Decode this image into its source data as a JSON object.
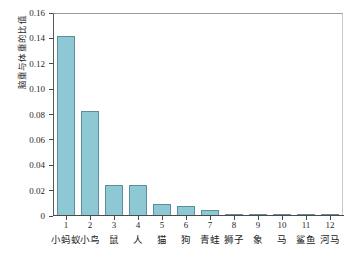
{
  "chart_data": {
    "type": "bar",
    "title": "",
    "subtitle": "",
    "xlabel": "",
    "ylabel": "脑重与体重的比值",
    "ylim": [
      0,
      0.16
    ],
    "xlim": [
      0.5,
      12.5
    ],
    "grid": false,
    "legend": null,
    "bar_color": "#8ec8d5",
    "bar_edge_color": "#5c8f9c",
    "axis_color": "#4a4a4a",
    "background": "#ffffff",
    "categories": [
      "1",
      "2",
      "3",
      "4",
      "5",
      "6",
      "7",
      "8",
      "9",
      "10",
      "11",
      "12"
    ],
    "category_names": [
      "小蚂蚁",
      "小鸟",
      "鼠",
      "人",
      "猫",
      "狗",
      "青蛙",
      "狮子",
      "象",
      "马",
      "鲨鱼",
      "河马"
    ],
    "values": [
      0.142,
      0.083,
      0.0245,
      0.0243,
      0.0095,
      0.0075,
      0.005,
      0.0015,
      0.0013,
      0.0012,
      0.0005,
      0.0003
    ],
    "ytick_values": [
      0,
      0.02,
      0.04,
      0.06,
      0.08,
      0.1,
      0.12,
      0.14,
      0.16
    ],
    "ytick_labels": [
      "0",
      "0.02",
      "0.04",
      "0.06",
      "0.08",
      "0.10",
      "0.12",
      "0.14",
      "0.16"
    ]
  }
}
